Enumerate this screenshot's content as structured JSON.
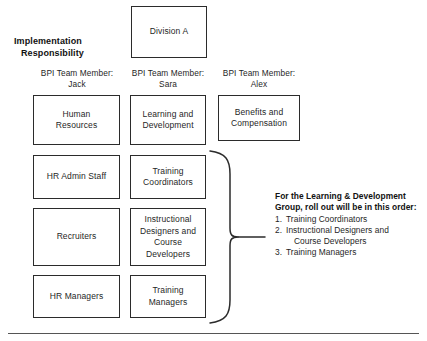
{
  "diagram": {
    "heading": {
      "line1": "Implementation",
      "line2": "Responsibility"
    },
    "root": {
      "label": "Division A"
    },
    "columns": [
      {
        "caption_line1": "BPI Team Member:",
        "caption_line2": "Jack",
        "nodes": [
          {
            "line1": "Human",
            "line2": "Resources"
          },
          {
            "line1": "HR Admin Staff",
            "line2": ""
          },
          {
            "line1": "Recruiters",
            "line2": ""
          },
          {
            "line1": "HR Managers",
            "line2": ""
          }
        ]
      },
      {
        "caption_line1": "BPI Team Member:",
        "caption_line2": "Sara",
        "nodes": [
          {
            "line1": "Learning and",
            "line2": "Development"
          },
          {
            "line1": "Training",
            "line2": "Coordinators"
          },
          {
            "line1": "Instructional",
            "line2": "Designers and",
            "line3": "Course",
            "line4": "Developers"
          },
          {
            "line1": "Training",
            "line2": "Managers"
          }
        ]
      },
      {
        "caption_line1": "BPI Team Member:",
        "caption_line2": "Alex",
        "nodes": [
          {
            "line1": "Benefits and",
            "line2": "Compensation"
          }
        ]
      }
    ],
    "callout": {
      "title_line1": "For the Learning & Development",
      "title_line2": "Group, roll out will be in this order:",
      "items": [
        {
          "num": "1.",
          "text": "Training Coordinators"
        },
        {
          "num": "2.",
          "text": "Instructional Designers and"
        },
        {
          "num": "",
          "text": "Course Developers"
        },
        {
          "num": "3.",
          "text": "Training Managers"
        }
      ]
    },
    "colors": {
      "box_border": "#2b2b2b",
      "text": "#1f1f1f",
      "rule": "#555555",
      "background": "#ffffff"
    }
  }
}
